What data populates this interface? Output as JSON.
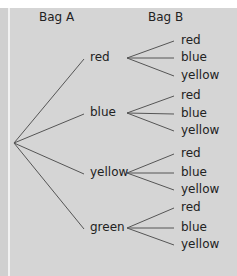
{
  "headers": {
    "bag_a": "Bag A",
    "bag_b": "Bag B"
  },
  "colors": {
    "background": "#d5d5d5",
    "line": "#555555",
    "text": "#222222"
  },
  "tree": {
    "root": {
      "x": 14,
      "y": 143
    },
    "bag_a": [
      {
        "label": "red",
        "y": 58,
        "children": [
          {
            "label": "red",
            "y": 41
          },
          {
            "label": "blue",
            "y": 58
          },
          {
            "label": "yellow",
            "y": 76
          }
        ]
      },
      {
        "label": "blue",
        "y": 113,
        "children": [
          {
            "label": "red",
            "y": 96
          },
          {
            "label": "blue",
            "y": 114
          },
          {
            "label": "yellow",
            "y": 131
          }
        ]
      },
      {
        "label": "yellow",
        "y": 173,
        "children": [
          {
            "label": "red",
            "y": 154
          },
          {
            "label": "blue",
            "y": 173
          },
          {
            "label": "yellow",
            "y": 190
          }
        ]
      },
      {
        "label": "green",
        "y": 228,
        "children": [
          {
            "label": "red",
            "y": 208
          },
          {
            "label": "blue",
            "y": 228
          },
          {
            "label": "yellow",
            "y": 245
          }
        ]
      }
    ]
  }
}
